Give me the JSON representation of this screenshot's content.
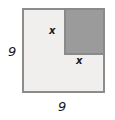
{
  "figure": {
    "type": "geometry-diagram",
    "background_color": "#ffffff"
  },
  "outer_square": {
    "name": "outer-square",
    "fill_color": "#f0efed",
    "border_color": "#8c8c8c",
    "side_label_left": "9",
    "side_label_bottom": "9"
  },
  "inner_square": {
    "name": "shaded-corner-square",
    "fill_color": "#9b9b9b",
    "border_color": "#8a8a8a",
    "position": "top-right",
    "side_label_vertical": "x",
    "side_label_horizontal": "x"
  },
  "labels": {
    "x_top": "x",
    "x_bottom": "x",
    "left_dimension": "9",
    "bottom_dimension": "9"
  }
}
